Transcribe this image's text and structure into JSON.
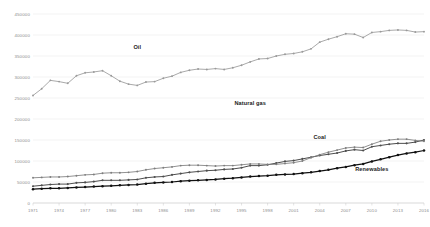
{
  "chart_data": {
    "type": "line",
    "title": "",
    "xlabel": "",
    "ylabel": "",
    "xlim": [
      1971,
      2016
    ],
    "ylim": [
      0,
      450000
    ],
    "grid": true,
    "legend_position": "inline-annotations",
    "ytick_labels": [
      "0",
      "50000",
      "100000",
      "150000",
      "200000",
      "250000",
      "300000",
      "350000",
      "400000",
      "450000"
    ],
    "ytick_values": [
      0,
      50000,
      100000,
      150000,
      200000,
      250000,
      300000,
      350000,
      400000,
      450000
    ],
    "xtick_labels": [
      "1971",
      "1974",
      "1977",
      "1980",
      "1983",
      "1986",
      "1989",
      "1992",
      "1995",
      "1998",
      "2001",
      "2004",
      "2007",
      "2010",
      "2013",
      "2016"
    ],
    "xtick_values": [
      1971,
      1974,
      1977,
      1980,
      1983,
      1986,
      1989,
      1992,
      1995,
      1998,
      2001,
      2004,
      2007,
      2010,
      2013,
      2016
    ],
    "x": [
      1971,
      1972,
      1973,
      1974,
      1975,
      1976,
      1977,
      1978,
      1979,
      1980,
      1981,
      1982,
      1983,
      1984,
      1985,
      1986,
      1987,
      1988,
      1989,
      1990,
      1991,
      1992,
      1993,
      1994,
      1995,
      1996,
      1997,
      1998,
      1999,
      2000,
      2001,
      2002,
      2003,
      2004,
      2005,
      2006,
      2007,
      2008,
      2009,
      2010,
      2011,
      2012,
      2013,
      2014,
      2015,
      2016
    ],
    "series": [
      {
        "name": "Oil",
        "color": "#9a9a9a",
        "marker": "circle",
        "label_x": 1983,
        "label_y": 372000,
        "values": [
          256000,
          272000,
          292000,
          289000,
          285000,
          303000,
          310000,
          312000,
          315000,
          303000,
          290000,
          283000,
          280000,
          288000,
          289000,
          297000,
          302000,
          311000,
          316000,
          319000,
          318000,
          320000,
          318000,
          322000,
          328000,
          336000,
          343000,
          344000,
          350000,
          354000,
          356000,
          360000,
          367000,
          383000,
          390000,
          396000,
          403000,
          402000,
          394000,
          406000,
          408000,
          411000,
          412000,
          411000,
          407000,
          408000
        ]
      },
      {
        "name": "Natural gas",
        "color": "#4d4d4d",
        "marker": "circle",
        "label_x": 1996,
        "label_y": 238000,
        "values": [
          40000,
          42000,
          44000,
          45000,
          45000,
          48000,
          49000,
          51000,
          54000,
          54000,
          54000,
          55000,
          56000,
          60000,
          62000,
          63000,
          67000,
          70000,
          73000,
          75000,
          77000,
          78000,
          80000,
          81000,
          84000,
          89000,
          89000,
          91000,
          95000,
          99000,
          101000,
          105000,
          109000,
          113000,
          116000,
          119000,
          124000,
          127000,
          125000,
          134000,
          137000,
          140000,
          142000,
          142000,
          145000,
          150000
        ]
      },
      {
        "name": "Coal",
        "color": "#7d7d7d",
        "marker": "circle",
        "label_x": 2004,
        "label_y": 156000,
        "values": [
          60000,
          61000,
          62000,
          62000,
          63000,
          65000,
          67000,
          68000,
          71000,
          72000,
          72000,
          73000,
          75000,
          79000,
          82000,
          84000,
          86000,
          89000,
          90000,
          90000,
          89000,
          88000,
          89000,
          89000,
          91000,
          93000,
          93000,
          92000,
          92000,
          94000,
          96000,
          100000,
          108000,
          115000,
          121000,
          126000,
          131000,
          133000,
          132000,
          140000,
          147000,
          150000,
          152000,
          152000,
          149000,
          147000
        ]
      },
      {
        "name": "Renewables",
        "color": "#111111",
        "marker": "circle",
        "label_x": 2010,
        "label_y": 82000,
        "values": [
          33000,
          34000,
          35000,
          35000,
          36000,
          37000,
          38000,
          39000,
          40000,
          41000,
          42000,
          43000,
          44000,
          46000,
          48000,
          49000,
          50000,
          52000,
          53000,
          54000,
          55000,
          56000,
          58000,
          59000,
          61000,
          63000,
          64000,
          65000,
          67000,
          68000,
          69000,
          71000,
          73000,
          76000,
          79000,
          83000,
          86000,
          90000,
          93000,
          99000,
          104000,
          109000,
          114000,
          118000,
          121000,
          125000
        ]
      }
    ]
  }
}
